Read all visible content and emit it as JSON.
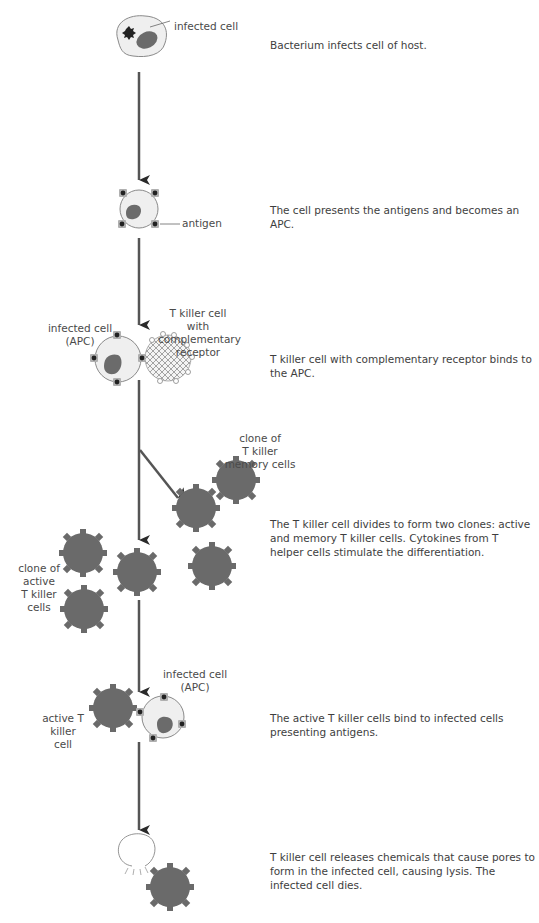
{
  "colors": {
    "arrow": "#555555",
    "arrow_head": "#2a2a2a",
    "cell_fill": "#efefef",
    "cell_outline": "#8a8a8a",
    "nucleus": "#6b6b6b",
    "t_cell_active": "#6a6a6a",
    "antigen_dot": "#222222",
    "antigen_base": "#aaaaaa"
  },
  "steps": [
    {
      "id": "infection",
      "labels": [
        "infected cell"
      ],
      "description": "Bacterium infects cell of host."
    },
    {
      "id": "presentation",
      "labels": [
        "antigen"
      ],
      "description": "The cell presents the antigens and becomes an APC."
    },
    {
      "id": "binding",
      "labels": [
        "infected cell",
        "(APC)",
        "T killer cell with",
        "complementary",
        "receptor"
      ],
      "description": "T killer cell with complementary receptor binds to the APC."
    },
    {
      "id": "division",
      "labels": [
        "clone of",
        "T killer",
        "memory cells",
        "clone of",
        "active",
        "T killer cells"
      ],
      "description": "The T killer cell divides to form two clones: active and memory T killer cells. Cytokines from T helper cells stimulate the differentiation."
    },
    {
      "id": "attack",
      "labels": [
        "infected cell",
        "(APC)",
        "active T killer",
        "cell"
      ],
      "description": "The active T killer cells bind to infected cells presenting antigens."
    },
    {
      "id": "lysis",
      "labels": [],
      "description": "T killer cell releases chemicals that cause pores to form in the infected cell, causing lysis. The infected cell dies."
    }
  ]
}
